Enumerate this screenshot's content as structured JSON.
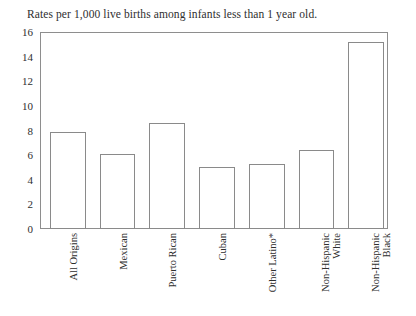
{
  "chart_data": {
    "type": "bar",
    "title": "Rates per 1,000 live births among infants less than 1 year old.",
    "xlabel": "",
    "ylabel": "",
    "ylim": [
      0,
      16
    ],
    "ytick_step": 2,
    "yticks": [
      "16",
      "14",
      "12",
      "10",
      "8",
      "6",
      "4",
      "2",
      "0"
    ],
    "grid": false,
    "legend": "none",
    "frame": "full-box",
    "bar_style": {
      "fill": "#ffffff",
      "edge": "#8a8a8a"
    },
    "categories": [
      "All Origins",
      "Mexican",
      "Puerto Rican",
      "Cuban",
      "Other Latino*",
      "Non-Hispanic White",
      "Non-Hispanic Black"
    ],
    "category_lines": [
      [
        "All Origins"
      ],
      [
        "Mexican"
      ],
      [
        "Puerto Rican"
      ],
      [
        "Cuban"
      ],
      [
        "Other Latino*"
      ],
      [
        "Non-Hispanic",
        "White"
      ],
      [
        "Non-Hispanic",
        "Black"
      ]
    ],
    "values": [
      7.9,
      6.1,
      8.6,
      5.0,
      5.3,
      6.4,
      15.2
    ]
  }
}
